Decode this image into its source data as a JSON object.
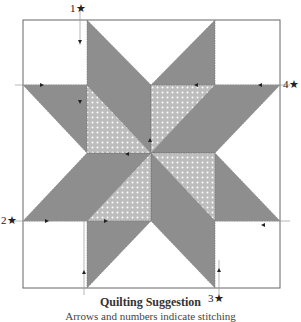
{
  "diagram": {
    "title": "Quilting Suggestion",
    "subtitle": "Arrows and numbers indicate stitching",
    "start_markers": [
      {
        "label": "1★",
        "position": "top-left"
      },
      {
        "label": "2★",
        "position": "left-bottom"
      },
      {
        "label": "3★",
        "position": "bottom-right"
      },
      {
        "label": "4★",
        "position": "right-top"
      }
    ],
    "colors": {
      "dark_fabric": "#8e8e8e",
      "light_fabric": "#c4c4c4",
      "outline": "#555555",
      "background": "#ffffff"
    }
  }
}
